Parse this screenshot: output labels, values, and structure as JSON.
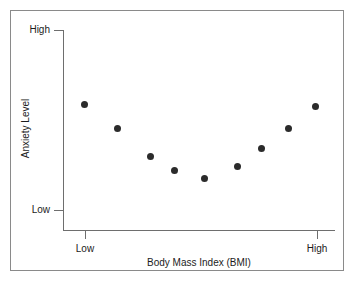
{
  "figure": {
    "background_color": "#ffffff",
    "frame_color": "#8a8a8a",
    "axis_color": "#6e6e6e",
    "marker_color": "#2b2b2b"
  },
  "chart_data": {
    "type": "scatter",
    "title": "",
    "xlabel": "Body Mass Index (BMI)",
    "ylabel": "Anxiety Level",
    "xtick_labels": [
      "Low",
      "High"
    ],
    "ytick_labels": [
      "High",
      "Low"
    ],
    "xlim": [
      "Low",
      "High"
    ],
    "ylim": [
      "Low",
      "High"
    ],
    "grid": false,
    "legend": "none",
    "relationship": "U-shaped (curvilinear / quadratic)",
    "marker_color": "#2b2b2b",
    "marker_size_px": 7,
    "x": [
      0.08,
      0.2,
      0.32,
      0.41,
      0.52,
      0.64,
      0.73,
      0.83,
      0.93
    ],
    "y": [
      0.63,
      0.51,
      0.37,
      0.3,
      0.26,
      0.32,
      0.41,
      0.51,
      0.62
    ],
    "points": [
      {
        "x": 0.08,
        "y": 0.63
      },
      {
        "x": 0.2,
        "y": 0.51
      },
      {
        "x": 0.32,
        "y": 0.37
      },
      {
        "x": 0.41,
        "y": 0.3
      },
      {
        "x": 0.52,
        "y": 0.26
      },
      {
        "x": 0.64,
        "y": 0.32
      },
      {
        "x": 0.73,
        "y": 0.41
      },
      {
        "x": 0.83,
        "y": 0.51
      },
      {
        "x": 0.93,
        "y": 0.62
      }
    ]
  }
}
